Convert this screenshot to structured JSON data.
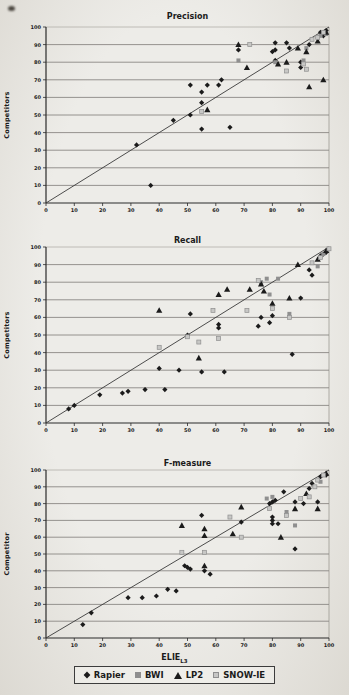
{
  "page": {
    "background": "#e9e6e1",
    "text_color": "#1b1b1b"
  },
  "footer": {
    "x_axis_label": "ELIE",
    "x_axis_label_sub": "L3"
  },
  "legend": {
    "position": "bottom",
    "items": [
      {
        "name": "Rapier",
        "marker": "diamond",
        "color": "#1b1b1b"
      },
      {
        "name": "BWI",
        "marker": "square",
        "color": "#8f8f8f"
      },
      {
        "name": "LP2",
        "marker": "triangle",
        "color": "#1b1b1b"
      },
      {
        "name": "SNOW-IE",
        "marker": "square",
        "color": "#c7c7c5",
        "border": "#8f8f8f"
      }
    ]
  },
  "chart_data": [
    {
      "type": "scatter",
      "title": "Precision",
      "xlabel": "",
      "ylabel": "Competitors",
      "xlim": [
        0,
        100
      ],
      "ylim": [
        0,
        100
      ],
      "x_ticks": [
        0,
        10,
        20,
        30,
        40,
        50,
        60,
        70,
        80,
        90,
        100
      ],
      "y_ticks": [
        0,
        10,
        20,
        30,
        40,
        50,
        60,
        70,
        80,
        90,
        100
      ],
      "grid": "horizontal",
      "diagonal_reference_line": true,
      "series": [
        {
          "name": "Rapier",
          "marker": "diamond",
          "color": "#1b1b1b",
          "points": [
            [
              37,
              10
            ],
            [
              32,
              33
            ],
            [
              45,
              47
            ],
            [
              51,
              50
            ],
            [
              55,
              42
            ],
            [
              65,
              43
            ],
            [
              51,
              67
            ],
            [
              55,
              57
            ],
            [
              55,
              63
            ],
            [
              57,
              67
            ],
            [
              61,
              67
            ],
            [
              62,
              70
            ],
            [
              68,
              87
            ],
            [
              80,
              86
            ],
            [
              81,
              91
            ],
            [
              81,
              87
            ],
            [
              81,
              81
            ],
            [
              85,
              91
            ],
            [
              86,
              88
            ],
            [
              90,
              77
            ],
            [
              90,
              80
            ],
            [
              93,
              90
            ],
            [
              97,
              97
            ],
            [
              98,
              95
            ],
            [
              99,
              98
            ]
          ]
        },
        {
          "name": "BWI",
          "marker": "square",
          "color": "#8f8f8f",
          "points": [
            [
              68,
              81
            ],
            [
              81,
              80
            ],
            [
              91,
              81
            ],
            [
              92,
              88
            ],
            [
              97,
              95
            ],
            [
              99,
              96
            ]
          ]
        },
        {
          "name": "LP2",
          "marker": "triangle",
          "color": "#1b1b1b",
          "points": [
            [
              57,
              53
            ],
            [
              68,
              90
            ],
            [
              71,
              77
            ],
            [
              82,
              79
            ],
            [
              85,
              80
            ],
            [
              89,
              88
            ],
            [
              92,
              86
            ],
            [
              93,
              66
            ],
            [
              96,
              92
            ],
            [
              98,
              70
            ],
            [
              99,
              97
            ]
          ]
        },
        {
          "name": "SNOW-IE",
          "marker": "square",
          "color": "#c7c7c5",
          "border": "#8f8f8f",
          "points": [
            [
              55,
              52
            ],
            [
              72,
              90
            ],
            [
              85,
              75
            ],
            [
              91,
              79
            ],
            [
              92,
              76
            ],
            [
              94,
              93
            ],
            [
              96,
              94
            ],
            [
              98,
              97
            ]
          ]
        }
      ]
    },
    {
      "type": "scatter",
      "title": "Recall",
      "xlabel": "",
      "ylabel": "Competitors",
      "xlim": [
        0,
        100
      ],
      "ylim": [
        0,
        100
      ],
      "x_ticks": [
        0,
        10,
        20,
        30,
        40,
        50,
        60,
        70,
        80,
        90,
        100
      ],
      "y_ticks": [
        0,
        10,
        20,
        30,
        40,
        50,
        60,
        70,
        80,
        90,
        100
      ],
      "grid": "horizontal",
      "diagonal_reference_line": true,
      "series": [
        {
          "name": "Rapier",
          "marker": "diamond",
          "color": "#1b1b1b",
          "points": [
            [
              8,
              8
            ],
            [
              10,
              10
            ],
            [
              19,
              16
            ],
            [
              27,
              17
            ],
            [
              29,
              18
            ],
            [
              35,
              19
            ],
            [
              42,
              19
            ],
            [
              40,
              31
            ],
            [
              47,
              30
            ],
            [
              55,
              29
            ],
            [
              63,
              29
            ],
            [
              50,
              50
            ],
            [
              51,
              62
            ],
            [
              61,
              56
            ],
            [
              61,
              54
            ],
            [
              75,
              55
            ],
            [
              76,
              60
            ],
            [
              79,
              57
            ],
            [
              80,
              61
            ],
            [
              87,
              39
            ],
            [
              90,
              71
            ],
            [
              93,
              87
            ],
            [
              94,
              84
            ],
            [
              97,
              95
            ],
            [
              98,
              96
            ],
            [
              99,
              97
            ]
          ]
        },
        {
          "name": "BWI",
          "marker": "square",
          "color": "#8f8f8f",
          "points": [
            [
              76,
              80
            ],
            [
              78,
              82
            ],
            [
              79,
              73
            ],
            [
              82,
              82
            ],
            [
              86,
              62
            ],
            [
              96,
              89
            ],
            [
              98,
              96
            ]
          ]
        },
        {
          "name": "LP2",
          "marker": "triangle",
          "color": "#1b1b1b",
          "points": [
            [
              40,
              64
            ],
            [
              54,
              37
            ],
            [
              61,
              73
            ],
            [
              64,
              76
            ],
            [
              72,
              76
            ],
            [
              76,
              79
            ],
            [
              77,
              75
            ],
            [
              80,
              68
            ],
            [
              86,
              71
            ],
            [
              89,
              90
            ],
            [
              96,
              93
            ],
            [
              99,
              98
            ]
          ]
        },
        {
          "name": "SNOW-IE",
          "marker": "square",
          "color": "#c7c7c5",
          "border": "#8f8f8f",
          "points": [
            [
              40,
              43
            ],
            [
              50,
              49
            ],
            [
              54,
              46
            ],
            [
              59,
              64
            ],
            [
              61,
              48
            ],
            [
              71,
              64
            ],
            [
              75,
              81
            ],
            [
              80,
              65
            ],
            [
              86,
              60
            ],
            [
              94,
              91
            ],
            [
              97,
              94
            ],
            [
              100,
              99
            ]
          ]
        }
      ]
    },
    {
      "type": "scatter",
      "title": "F-measure",
      "xlabel": "ELIE_L3",
      "ylabel": "Competitor",
      "xlim": [
        0,
        100
      ],
      "ylim": [
        0,
        100
      ],
      "x_ticks": [
        0,
        10,
        20,
        30,
        40,
        50,
        60,
        70,
        80,
        90,
        100
      ],
      "y_ticks": [
        0,
        10,
        20,
        30,
        40,
        50,
        60,
        70,
        80,
        90,
        100
      ],
      "grid": "horizontal",
      "diagonal_reference_line": true,
      "series": [
        {
          "name": "Rapier",
          "marker": "diamond",
          "color": "#1b1b1b",
          "points": [
            [
              13,
              8
            ],
            [
              16,
              15
            ],
            [
              29,
              24
            ],
            [
              34,
              24
            ],
            [
              39,
              25
            ],
            [
              43,
              29
            ],
            [
              46,
              28
            ],
            [
              49,
              43
            ],
            [
              50,
              42
            ],
            [
              51,
              41
            ],
            [
              56,
              40
            ],
            [
              58,
              38
            ],
            [
              55,
              73
            ],
            [
              69,
              69
            ],
            [
              79,
              80
            ],
            [
              80,
              81
            ],
            [
              81,
              82
            ],
            [
              80,
              72
            ],
            [
              80,
              70
            ],
            [
              80,
              68
            ],
            [
              82,
              68
            ],
            [
              84,
              87
            ],
            [
              88,
              53
            ],
            [
              88,
              81
            ],
            [
              91,
              80
            ],
            [
              93,
              89
            ],
            [
              96,
              81
            ],
            [
              94,
              92
            ],
            [
              97,
              96
            ],
            [
              99,
              97
            ]
          ]
        },
        {
          "name": "BWI",
          "marker": "square",
          "color": "#8f8f8f",
          "points": [
            [
              78,
              83
            ],
            [
              80,
              84
            ],
            [
              85,
              75
            ],
            [
              88,
              67
            ],
            [
              97,
              93
            ]
          ]
        },
        {
          "name": "LP2",
          "marker": "triangle",
          "color": "#1b1b1b",
          "points": [
            [
              48,
              67
            ],
            [
              56,
              43
            ],
            [
              56,
              65
            ],
            [
              56,
              61
            ],
            [
              66,
              62
            ],
            [
              69,
              78
            ],
            [
              83,
              60
            ],
            [
              88,
              77
            ],
            [
              92,
              86
            ],
            [
              96,
              77
            ],
            [
              99,
              98
            ]
          ]
        },
        {
          "name": "SNOW-IE",
          "marker": "square",
          "color": "#c7c7c5",
          "border": "#8f8f8f",
          "points": [
            [
              48,
              51
            ],
            [
              56,
              51
            ],
            [
              65,
              72
            ],
            [
              69,
              60
            ],
            [
              79,
              77
            ],
            [
              85,
              73
            ],
            [
              90,
              83
            ],
            [
              93,
              84
            ],
            [
              95,
              90
            ],
            [
              96,
              94
            ],
            [
              98,
              97
            ]
          ]
        }
      ]
    }
  ]
}
